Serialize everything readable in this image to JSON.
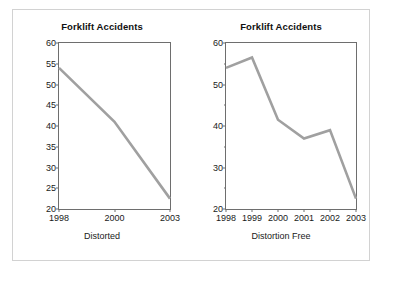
{
  "figure": {
    "panels": [
      {
        "id": "distorted",
        "caption": "Distorted",
        "chart_data": {
          "type": "line",
          "title": "Forklift Accidents",
          "xlabel": "Distorted",
          "ylabel": "",
          "x": [
            "1998",
            "2000",
            "2003"
          ],
          "categories": [
            "1998",
            "2000",
            "2003"
          ],
          "values": [
            54,
            41,
            22.5
          ],
          "series": [
            {
              "name": "Forklift Accidents",
              "values": [
                54,
                41,
                22.5
              ]
            }
          ],
          "ylim": [
            20,
            60
          ],
          "ytick_labels": [
            "20",
            "25",
            "30",
            "35",
            "40",
            "45",
            "50",
            "55",
            "60"
          ],
          "ytick_values": [
            20,
            25,
            30,
            35,
            40,
            45,
            50,
            55,
            60
          ],
          "xtick_labels": [
            "1998",
            "2000",
            "2003"
          ],
          "grid": false,
          "legend": "none",
          "note": "x axis categories evenly spaced although year gaps are unequal"
        }
      },
      {
        "id": "clean",
        "caption": "Distortion Free",
        "chart_data": {
          "type": "line",
          "title": "Forklift Accidents",
          "xlabel": "Distortion Free",
          "ylabel": "",
          "x": [
            "1998",
            "1999",
            "2000",
            "2001",
            "2002",
            "2003"
          ],
          "categories": [
            "1998",
            "1999",
            "2000",
            "2001",
            "2002",
            "2003"
          ],
          "values": [
            54,
            56.5,
            41.5,
            37,
            39,
            22.5
          ],
          "series": [
            {
              "name": "Forklift Accidents",
              "values": [
                54,
                56.5,
                41.5,
                37,
                39,
                22.5
              ]
            }
          ],
          "ylim": [
            20,
            60
          ],
          "ytick_labels": [
            "20",
            "30",
            "40",
            "50",
            "60"
          ],
          "ytick_values": [
            20,
            30,
            40,
            50,
            60
          ],
          "ytick_minor_values": [
            25,
            35,
            45,
            55
          ],
          "xtick_labels": [
            "1998",
            "1999",
            "2000",
            "2001",
            "2002",
            "2003"
          ],
          "grid": false,
          "legend": "none",
          "note": "every year shown at true even spacing"
        }
      }
    ],
    "colors": {
      "line": "#a0a0a0",
      "axis": "#6e6e6e",
      "frame": "#d2d2d2",
      "text": "#1a1a1a",
      "background": "#ffffff"
    }
  }
}
